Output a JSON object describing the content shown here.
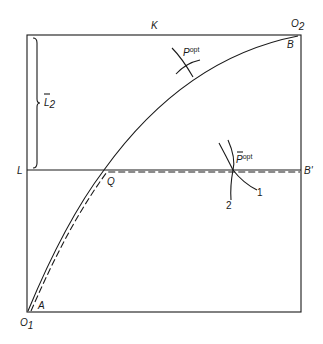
{
  "diagram": {
    "type": "edgeworth-box",
    "colors": {
      "ink": "#1a1a1a",
      "background": "#ffffff"
    },
    "labels": {
      "top_edge": "K",
      "top_right_origin": "O",
      "top_right_origin_sub": "2",
      "bottom_left_origin": "O",
      "bottom_left_origin_sub": "1",
      "left_level": "L",
      "right_level": "B'",
      "point_A": "A",
      "point_B": "B",
      "point_Q": "Q",
      "brace_label": "L",
      "brace_label_sub": "2",
      "p_opt": "P",
      "p_opt_sup": "opt",
      "p_bar_opt": "P",
      "p_bar_opt_sup": "opt",
      "curve_1": "1",
      "curve_2": "2"
    },
    "elements": [
      "box frame O1-O2",
      "solid contract curve from A (O1) to B (O2)",
      "horizontal constraint line L to B'",
      "dashed constrained path from A through Q to B'",
      "brace marking L2 above line L",
      "tangent indifference curves at P_opt",
      "crossing indifference curves 1 and 2 at P-bar_opt"
    ]
  }
}
